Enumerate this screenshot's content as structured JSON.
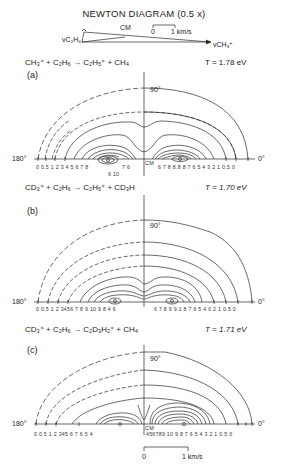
{
  "newton_diagram": {
    "title": "NEWTON DIAGRAM (0.5 x)",
    "labels": {
      "v_c2h6": "C₂H₆",
      "v_ch3": "CH₃⁺",
      "cm": "CM",
      "scale_zero": "0",
      "scale_unit": "1 km/s"
    }
  },
  "panels": [
    {
      "label": "(a)",
      "reaction_left": "CH₃⁺ + C₂H₆",
      "arrow": "→",
      "reaction_right": "C₂H₅⁺ + CH₄",
      "temperature": "T = 1.78 eV",
      "angle_top": "90°",
      "angle_left": "180°",
      "angle_right": "0°",
      "cm_label": "CM",
      "left_ticks": "0 0.5 1 2   3 4 5 6 7 8",
      "left_ticks_lower": "9 10",
      "left_ticks_after": "7 6",
      "right_ticks": "6 7 8 8.8 8 7 6  5 4 3 2 1 0.5 0"
    },
    {
      "label": "(b)",
      "reaction_left": "CD₃⁺ + C₂H₆",
      "arrow": "→",
      "reaction_right": "C₂H₅⁺ + CD₃H",
      "temperature": "T = 1.70 eV",
      "angle_top": "90°",
      "angle_left": "180°",
      "angle_right": "0°",
      "cm_label": "",
      "left_ticks": "0 0.5 1   2   3456 7 8 9 10  9 8 4 6",
      "right_ticks": "6 7 8 9 9.1 8 7 6 5 4 0   2   1 0.5 0"
    },
    {
      "label": "(c)",
      "reaction_left": "CD₃⁺ + C₂H₆",
      "arrow": "→",
      "reaction_right": "C₂D₃H₂⁺ + CH₄",
      "temperature": "T = 1.71 eV",
      "angle_top": "90°",
      "angle_left": "180°",
      "angle_right": "0°",
      "cm_label": "CM",
      "left_ticks": "0  0.5 1     2      345  6  7 6 5 4",
      "right_ticks": "456789  10  9 8 7 6 5 4 3 2 1 0.5 0"
    }
  ],
  "scale_bar": {
    "zero": "0",
    "unit": "1 km/s"
  },
  "colors": {
    "line": "#2a2a2a",
    "background": "#ffffff"
  }
}
